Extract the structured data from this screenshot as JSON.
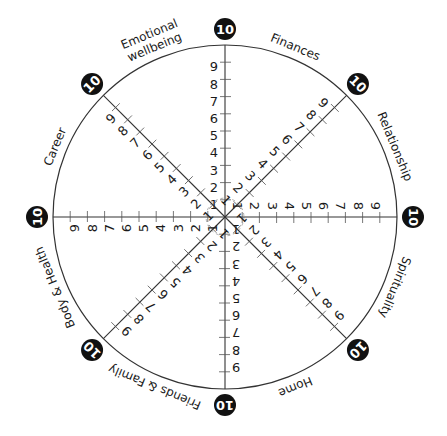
{
  "diagram": {
    "title": "",
    "type": "wheel-of-life",
    "center": [
      225,
      217
    ],
    "radius": 172,
    "scale": {
      "min": 1,
      "max": 9,
      "outer_value": "10"
    },
    "tick_labels": [
      "1",
      "2",
      "3",
      "4",
      "5",
      "6",
      "7",
      "8",
      "9"
    ],
    "outer_badge_label": "10",
    "colors": {
      "line": "#333333",
      "tick": "#555555",
      "badge_fill": "#111111",
      "badge_text": "#ffffff",
      "inner_ring": "#999999"
    },
    "categories": [
      {
        "name": "Finances",
        "lines": [
          "Finances"
        ]
      },
      {
        "name": "Relationship",
        "lines": [
          "Relationship"
        ]
      },
      {
        "name": "Spirituality",
        "lines": [
          "Spirituality"
        ]
      },
      {
        "name": "Home",
        "lines": [
          "Home"
        ]
      },
      {
        "name": "Friends & Family",
        "lines": [
          "Friends & Family"
        ]
      },
      {
        "name": "Body & Health",
        "lines": [
          "Body & Health"
        ]
      },
      {
        "name": "Career",
        "lines": [
          "Career"
        ]
      },
      {
        "name": "Emotional wellbeing",
        "lines": [
          "Emotional",
          "wellbeing"
        ]
      }
    ]
  }
}
